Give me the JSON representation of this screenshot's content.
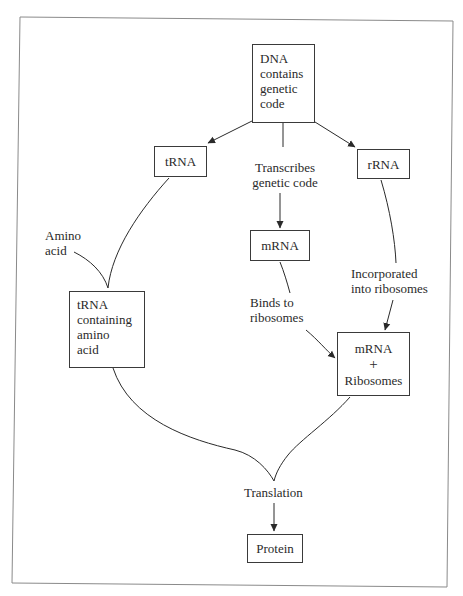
{
  "diagram": {
    "title": "",
    "colors": {
      "stroke": "#3a3a3a",
      "text": "#2a2a2a",
      "frame": "#8a8a8a",
      "background": "#ffffff"
    },
    "nodes": {
      "dna": {
        "lines": [
          "DNA",
          "contains",
          "genetic",
          "code"
        ]
      },
      "trna": {
        "lines": [
          "tRNA"
        ]
      },
      "rrna": {
        "lines": [
          "rRNA"
        ]
      },
      "mrna": {
        "lines": [
          "mRNA"
        ]
      },
      "trna_amino": {
        "lines": [
          "tRNA",
          "containing",
          "amino",
          "acid"
        ]
      },
      "mrna_ribosomes": {
        "lines": [
          "mRNA",
          "+",
          "Ribosomes"
        ]
      },
      "protein": {
        "lines": [
          "Protein"
        ]
      }
    },
    "labels": {
      "transcribes": {
        "lines": [
          "Transcribes",
          "genetic code"
        ]
      },
      "amino_acid": {
        "lines": [
          "Amino",
          "acid"
        ]
      },
      "binds": {
        "lines": [
          "Binds to",
          "ribosomes"
        ]
      },
      "incorporated": {
        "lines": [
          "Incorporated",
          "into ribosomes"
        ]
      },
      "translation": {
        "lines": [
          "Translation"
        ]
      }
    },
    "edges": [
      {
        "from": "DNA contains genetic code",
        "to": "tRNA",
        "label": ""
      },
      {
        "from": "DNA contains genetic code",
        "to": "mRNA",
        "label": "Transcribes genetic code"
      },
      {
        "from": "DNA contains genetic code",
        "to": "rRNA",
        "label": ""
      },
      {
        "from": "tRNA",
        "to": "tRNA containing amino acid",
        "label": ""
      },
      {
        "from": "Amino acid",
        "to": "tRNA containing amino acid",
        "label": ""
      },
      {
        "from": "mRNA",
        "to": "mRNA + Ribosomes",
        "label": "Binds to ribosomes"
      },
      {
        "from": "rRNA",
        "to": "mRNA + Ribosomes",
        "label": "Incorporated into ribosomes"
      },
      {
        "from": "tRNA containing amino acid",
        "to": "Translation",
        "label": ""
      },
      {
        "from": "mRNA + Ribosomes",
        "to": "Translation",
        "label": ""
      },
      {
        "from": "Translation",
        "to": "Protein",
        "label": ""
      }
    ]
  }
}
